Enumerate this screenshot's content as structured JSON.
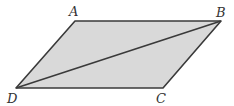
{
  "diagram": {
    "shape": "parallelogram",
    "fill_color": "#d9d9d9",
    "stroke_color": "#3a3a3a",
    "vertices": [
      {
        "label": "A",
        "x": 75,
        "y": 21
      },
      {
        "label": "B",
        "x": 221,
        "y": 21
      },
      {
        "label": "C",
        "x": 163,
        "y": 88
      },
      {
        "label": "D",
        "x": 16,
        "y": 88
      }
    ],
    "diagonal": {
      "from": "B",
      "to": "D"
    },
    "labels": {
      "A": "A",
      "B": "B",
      "C": "C",
      "D": "D"
    }
  }
}
